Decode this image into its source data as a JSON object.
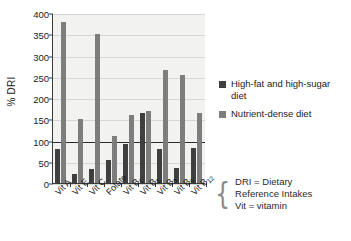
{
  "chart_data": {
    "type": "bar",
    "title": "",
    "xlabel": "",
    "ylabel": "% DRI",
    "ylim": [
      0,
      400
    ],
    "ytick_step": 50,
    "yticks": [
      "400",
      "350",
      "300",
      "250",
      "200",
      "150",
      "100",
      "50",
      "0"
    ],
    "grid": true,
    "reference_line": {
      "value": 100,
      "label": "100% DRI"
    },
    "legend_position": "right",
    "categories": [
      "Vit A",
      "Vit E",
      "Vit C",
      "Folate",
      "Vit B1",
      "Vit B2",
      "Vit B3",
      "Vit B6",
      "Vit B12"
    ],
    "category_labels": [
      {
        "base": "Vit A",
        "sub": ""
      },
      {
        "base": "Vit E",
        "sub": ""
      },
      {
        "base": "Vit C",
        "sub": ""
      },
      {
        "base": "Folate",
        "sub": ""
      },
      {
        "base": "Vit B",
        "sub": "1"
      },
      {
        "base": "Vit B",
        "sub": "2"
      },
      {
        "base": "Vit B",
        "sub": "3"
      },
      {
        "base": "Vit B",
        "sub": "6"
      },
      {
        "base": "Vit B",
        "sub": "12"
      }
    ],
    "series": [
      {
        "name": "High-fat and high-sugar diet",
        "color": "#3f3f3f",
        "values": [
          80,
          22,
          33,
          55,
          92,
          165,
          80,
          35,
          83
        ]
      },
      {
        "name": "Nutrient-dense diet",
        "color": "#7d7d7d",
        "values": [
          378,
          150,
          350,
          110,
          160,
          170,
          265,
          255,
          165
        ]
      }
    ]
  },
  "legend": {
    "entries": [
      {
        "label": "High-fat and high-sugar diet",
        "color": "#3f3f3f"
      },
      {
        "label": "Nutrient-dense diet",
        "color": "#7d7d7d"
      }
    ]
  },
  "footnote": {
    "brace": "{",
    "lines": [
      "DRI = Dietary",
      "Reference Intakes",
      "Vit = vitamin"
    ]
  }
}
